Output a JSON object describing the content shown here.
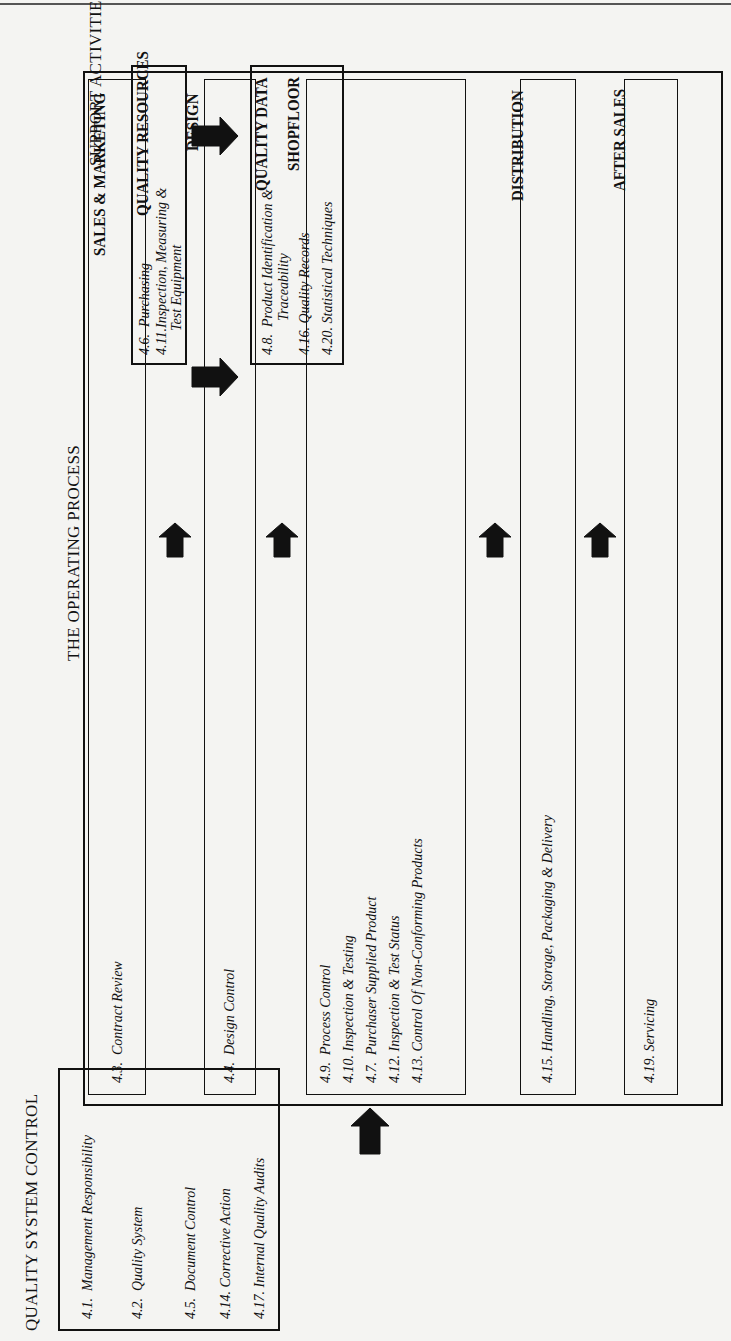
{
  "diagram": {
    "orientation": "rotated-90-ccw",
    "sections": {
      "support_activities": {
        "title": "SUPPORT ACTIVITIES",
        "quality_resources": {
          "title": "QUALITY RESOURCES",
          "items": [
            {
              "code": "4.6.",
              "label": "Purchasing"
            },
            {
              "code": "4.11.",
              "label": "Inspection, Measuring &",
              "label2": "Test Equipment"
            },
            {
              "code": "4.18.",
              "label": "Training"
            }
          ]
        },
        "quality_data": {
          "title": "QUALITY DATA",
          "items": [
            {
              "code": "4.8.",
              "label": "Product Identification &",
              "label2": "Traceability"
            },
            {
              "code": "4.16.",
              "label": "Quality Records"
            },
            {
              "code": "4.20.",
              "label": "Statistical Techniques"
            }
          ]
        }
      },
      "operating_process": {
        "title": "THE OPERATING PROCESS",
        "stages": [
          {
            "title": "SALES & MARKETING",
            "items": [
              {
                "code": "4.3.",
                "label": "Contract Review"
              }
            ]
          },
          {
            "title": "DESIGN",
            "items": [
              {
                "code": "4.4.",
                "label": "Design Control"
              }
            ]
          },
          {
            "title": "SHOPFLOOR",
            "items": [
              {
                "code": "4.9.",
                "label": "Process Control"
              },
              {
                "code": "4.10.",
                "label": "Inspection & Testing"
              },
              {
                "code": "4.7.",
                "label": "Purchaser Supplied Product"
              },
              {
                "code": "4.12.",
                "label": "Inspection & Test Status"
              },
              {
                "code": "4.13.",
                "label": "Control Of Non-Conforming Products"
              }
            ]
          },
          {
            "title": "DISTRIBUTION",
            "items": [
              {
                "code": "4.15.",
                "label": "Handling, Storage, Packaging & Delivery"
              }
            ]
          },
          {
            "title": "AFTER SALES",
            "items": [
              {
                "code": "4.19.",
                "label": "Servicing"
              }
            ]
          }
        ]
      },
      "quality_system_control": {
        "title": "QUALITY SYSTEM CONTROL",
        "items": [
          {
            "code": "4.1.",
            "label": "Management Responsibility"
          },
          {
            "code": "4.2.",
            "label": "Quality System"
          },
          {
            "code": "4.5.",
            "label": "Document Control"
          },
          {
            "code": "4.14.",
            "label": "Corrective Action"
          },
          {
            "code": "4.17.",
            "label": "Internal Quality Audits"
          }
        ]
      }
    },
    "arrow_color": "#111111",
    "line_color": "#111111",
    "background": "#f4f4f2"
  }
}
